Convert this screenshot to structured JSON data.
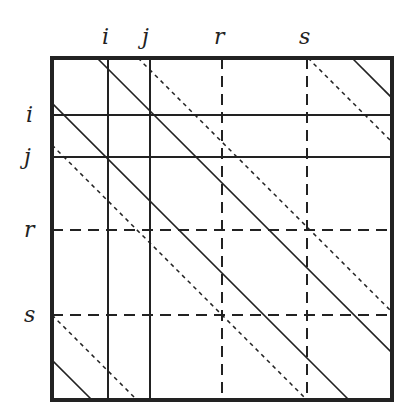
{
  "diagram": {
    "frame": {
      "x": 52,
      "y": 58,
      "width": 340,
      "height": 342
    },
    "column_labels": [
      {
        "text": "i",
        "x": 106
      },
      {
        "text": "j",
        "x": 148
      },
      {
        "text": "r",
        "x": 221
      },
      {
        "text": "s",
        "x": 305
      }
    ],
    "row_labels": [
      {
        "text": "i",
        "y": 115
      },
      {
        "text": "j",
        "y": 157
      },
      {
        "text": "r",
        "y": 230
      },
      {
        "text": "s",
        "y": 315
      }
    ],
    "colors": {
      "line": "#222222",
      "background": "#ffffff"
    }
  }
}
